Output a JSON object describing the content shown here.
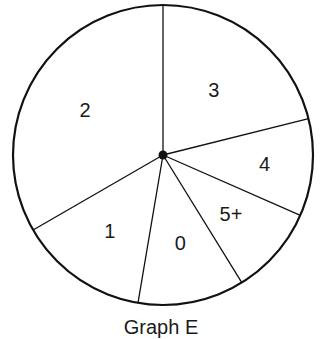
{
  "chart_data": {
    "type": "pie",
    "title": "Graph E",
    "categories": [
      "3",
      "4",
      "5+",
      "0",
      "1",
      "2"
    ],
    "values": [
      21.1,
      10.5,
      9.6,
      11.5,
      14.0,
      33.3
    ],
    "angles_deg": [
      76,
      37.7,
      34.6,
      41.3,
      50.4,
      120
    ],
    "start_angle_deg": 90,
    "direction": "clockwise",
    "legend": "none",
    "labels_inside": true,
    "colors": {
      "fill": "#ffffff",
      "stroke": "#111111"
    }
  },
  "caption": "Graph E"
}
